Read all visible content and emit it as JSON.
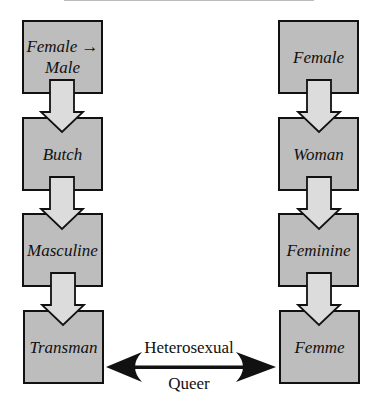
{
  "diagram": {
    "left_column": {
      "boxes": [
        {
          "label_line1": "Female →",
          "label_line2": "Male"
        },
        {
          "label_line1": "Butch",
          "label_line2": ""
        },
        {
          "label_line1": "Masculine",
          "label_line2": ""
        },
        {
          "label_line1": "Transman",
          "label_line2": ""
        }
      ]
    },
    "right_column": {
      "boxes": [
        {
          "label_line1": "Female",
          "label_line2": ""
        },
        {
          "label_line1": "Woman",
          "label_line2": ""
        },
        {
          "label_line1": "Feminine",
          "label_line2": ""
        },
        {
          "label_line1": "Femme",
          "label_line2": ""
        }
      ]
    },
    "relation": {
      "top_label": "Heterosexual",
      "bottom_label": "Queer"
    },
    "colors": {
      "box_fill": "#bdbdbd",
      "arrow_fill": "#dcdcdc",
      "stroke": "#111111"
    }
  }
}
